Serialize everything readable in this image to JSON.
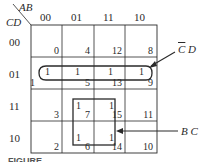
{
  "map": {
    "row_var": "CD",
    "col_var": "AB",
    "col_headers": [
      "00",
      "01",
      "11",
      "10"
    ],
    "row_headers": [
      "00",
      "01",
      "11",
      "10"
    ],
    "cells": [
      [
        {
          "index": "0",
          "value": ""
        },
        {
          "index": "4",
          "value": ""
        },
        {
          "index": "12",
          "value": ""
        },
        {
          "index": "8",
          "value": ""
        }
      ],
      [
        {
          "index": "1",
          "value": "1"
        },
        {
          "index": "5",
          "value": "1"
        },
        {
          "index": "13",
          "value": "1"
        },
        {
          "index": "9",
          "value": "1"
        }
      ],
      [
        {
          "index": "3",
          "value": ""
        },
        {
          "index": "7",
          "value": "1"
        },
        {
          "index": "15",
          "value": "1"
        },
        {
          "index": "11",
          "value": ""
        }
      ],
      [
        {
          "index": "2",
          "value": ""
        },
        {
          "index": "6",
          "value": "1"
        },
        {
          "index": "14",
          "value": "1"
        },
        {
          "index": "10",
          "value": ""
        }
      ]
    ]
  },
  "groups": [
    {
      "label_bar": "C",
      "label_rest": " D",
      "color": "#2a2a2a"
    },
    {
      "label": "B C",
      "color": "#2a2a2a"
    }
  ],
  "caption": "FIGURE"
}
